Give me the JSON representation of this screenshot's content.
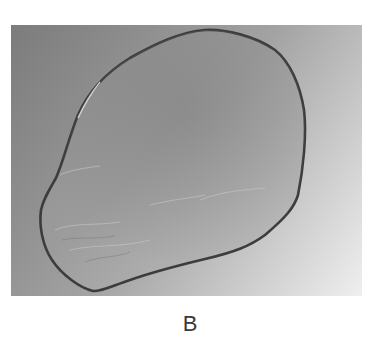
{
  "figure": {
    "panel_label": "B"
  },
  "colors": {
    "background_dark": "#7c7c7c",
    "background_light": "#efefef",
    "film_fill": "#9a9a9a",
    "film_outline": "#3c3c3c",
    "caption": "#3a3a3a"
  }
}
